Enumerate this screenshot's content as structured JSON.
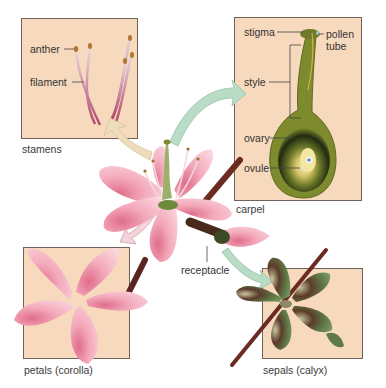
{
  "diagram": {
    "panels": {
      "stamens": {
        "caption": "stamens",
        "labels": {
          "anther": "anther",
          "filament": "filament"
        }
      },
      "carpel": {
        "caption": "carpel",
        "labels": {
          "stigma": "stigma",
          "pollen_tube_line1": "pollen",
          "pollen_tube_line2": "tube",
          "style": "style",
          "ovary": "ovary",
          "ovule": "ovule"
        }
      },
      "petals": {
        "caption": "petals (corolla)"
      },
      "sepals": {
        "caption": "sepals (calyx)"
      }
    },
    "center": {
      "receptacle_label": "receptacle"
    },
    "colors": {
      "panel_bg": "#f7d9bd",
      "panel_border": "#6e625a",
      "petal_pink": "#f3a9bb",
      "petal_deep": "#e06d8a",
      "stem_brown": "#6b2a22",
      "carpel_green": "#7d8a2e",
      "sepal_green": "#5f7a48",
      "arrow_green": "#b9dcc6",
      "arrow_tan": "#eedcbc",
      "arrow_pink": "#f4d3da"
    }
  }
}
